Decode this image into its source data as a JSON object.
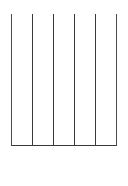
{
  "document": {
    "kind": "scanned-grid-table",
    "background_color": "#ffffff",
    "description": "Empty hand-drawn grid table, no text content"
  },
  "grid": {
    "columns": 5,
    "rows": 6,
    "cell_text": [
      [
        "",
        "",
        "",
        "",
        ""
      ],
      [
        "",
        "",
        "",
        "",
        ""
      ],
      [
        "",
        "",
        "",
        "",
        ""
      ],
      [
        "",
        "",
        "",
        "",
        ""
      ],
      [
        "",
        "",
        "",
        "",
        ""
      ],
      [
        "",
        "",
        "",
        "",
        ""
      ]
    ],
    "line_color": "#3a3a3a",
    "line_color_light": "#9a9a9a",
    "line_width": 1.5,
    "bottom_border_visible": false,
    "bounds": {
      "left": 11,
      "top": 14,
      "right": 116,
      "bottom": 186
    },
    "vertical_line_x": [
      11,
      32,
      53,
      74,
      95,
      116
    ],
    "horizontal_line_y": [
      14,
      40,
      66,
      92,
      118,
      145
    ]
  }
}
